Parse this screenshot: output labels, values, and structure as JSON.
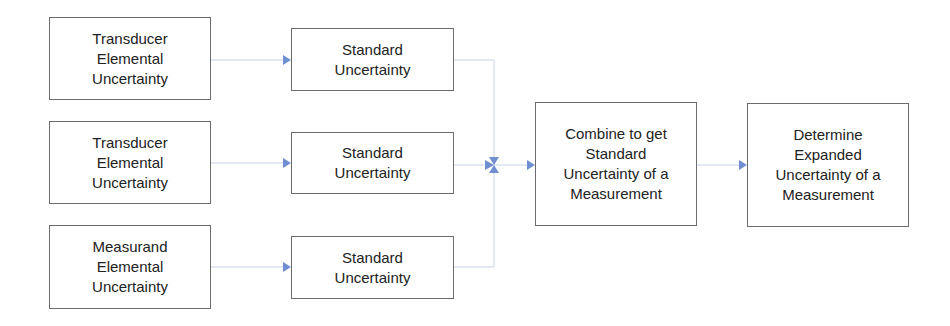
{
  "diagram": {
    "colors": {
      "connector": "#c5d3e6",
      "arrowhead": "#6f8fd1",
      "border": "#6b6b6b"
    },
    "sources": [
      {
        "label": "Transducer\nElemental\nUncertainty"
      },
      {
        "label": "Transducer\nElemental\nUncertainty"
      },
      {
        "label": "Measurand\nElemental\nUncertainty"
      }
    ],
    "standard": [
      {
        "label": "Standard\nUncertainty"
      },
      {
        "label": "Standard\nUncertainty"
      },
      {
        "label": "Standard\nUncertainty"
      }
    ],
    "combine": {
      "label": "Combine to get\nStandard\nUncertainty of a\nMeasurement"
    },
    "expanded": {
      "label": "Determine\nExpanded\nUncertainty of a\nMeasurement"
    }
  }
}
